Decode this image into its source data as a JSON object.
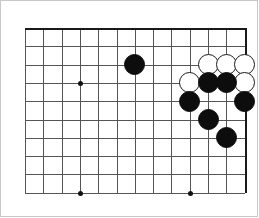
{
  "diagram": {
    "kind": "go-board-diagram",
    "board": {
      "visible_columns": 13,
      "visible_rows": 10,
      "cell_size": 18.3,
      "origin_x": 18,
      "origin_y": 21,
      "line_color": "#555555",
      "border_color": "#1a1a1a",
      "background_color": "#ffffff",
      "top_edge_is_board_border": true,
      "right_edge_is_board_border": true
    },
    "star_points": [
      {
        "col": 3,
        "row": 3,
        "name": "hoshi-upper-left"
      },
      {
        "col": 3,
        "row": 9,
        "name": "hoshi-lower-left"
      },
      {
        "col": 9,
        "row": 9,
        "name": "hoshi-lower-right"
      }
    ],
    "stones": [
      {
        "color": "black",
        "col": 6,
        "row": 2,
        "label": "black-stone-1"
      },
      {
        "color": "white",
        "col": 10,
        "row": 2,
        "label": "white-stone-1"
      },
      {
        "color": "white",
        "col": 11,
        "row": 2,
        "label": "white-stone-2"
      },
      {
        "color": "white",
        "col": 12,
        "row": 2,
        "label": "white-stone-3"
      },
      {
        "color": "white",
        "col": 9,
        "row": 3,
        "label": "white-stone-4"
      },
      {
        "color": "black",
        "col": 10,
        "row": 3,
        "label": "black-stone-2"
      },
      {
        "color": "black",
        "col": 11,
        "row": 3,
        "label": "black-stone-3"
      },
      {
        "color": "white",
        "col": 12,
        "row": 3,
        "label": "white-stone-5"
      },
      {
        "color": "black",
        "col": 9,
        "row": 4,
        "label": "black-stone-4"
      },
      {
        "color": "black",
        "col": 12,
        "row": 4,
        "label": "black-stone-5"
      },
      {
        "color": "black",
        "col": 10,
        "row": 5,
        "label": "black-stone-6"
      },
      {
        "color": "black",
        "col": 11,
        "row": 6,
        "label": "black-stone-7"
      }
    ],
    "stone_radius": 10.5,
    "counts": {
      "black": 7,
      "white": 5,
      "total": 12
    }
  }
}
